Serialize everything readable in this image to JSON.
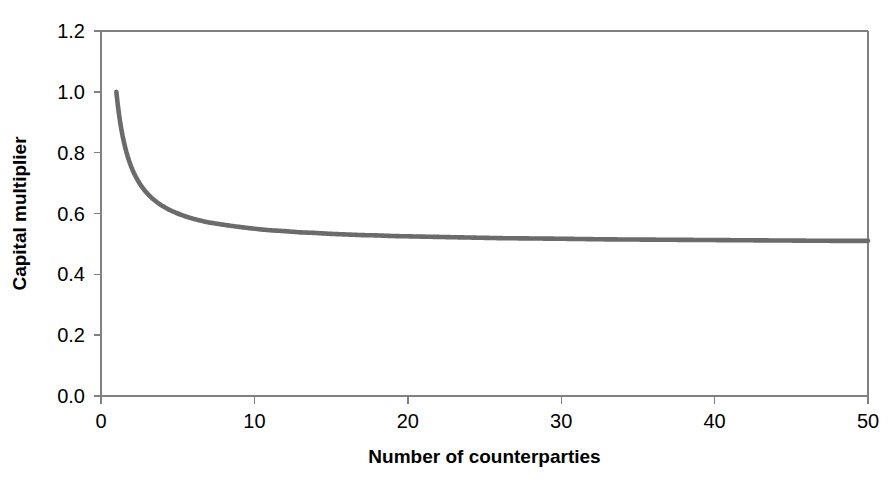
{
  "chart_data": {
    "type": "line",
    "title": "",
    "subtitle": "",
    "xlabel": "Number of counterparties",
    "ylabel": "Capital multiplier",
    "xlim": [
      0,
      50
    ],
    "ylim": [
      0.0,
      1.2
    ],
    "xticks": [
      0,
      10,
      20,
      30,
      40,
      50
    ],
    "xticklabels": [
      "0",
      "10",
      "20",
      "30",
      "40",
      "50"
    ],
    "yticks": [
      0.0,
      0.2,
      0.4,
      0.6,
      0.8,
      1.0,
      1.2
    ],
    "yticklabels": [
      "0.0",
      "0.2",
      "0.4",
      "0.6",
      "0.8",
      "1.0",
      "1.2"
    ],
    "grid": false,
    "legend": false,
    "legend_position": "none",
    "series": [
      {
        "name": "Capital multiplier",
        "color": "#6b6b6b",
        "line_width": 4.6,
        "x": [
          1,
          2,
          3,
          4,
          5,
          6,
          7,
          8,
          9,
          10,
          11,
          12,
          13,
          14,
          15,
          16,
          17,
          18,
          19,
          20,
          22,
          24,
          26,
          28,
          30,
          33,
          36,
          39,
          42,
          45,
          48,
          50
        ],
        "values": [
          1.0,
          0.75,
          0.667,
          0.625,
          0.6,
          0.583,
          0.571,
          0.563,
          0.556,
          0.55,
          0.545,
          0.542,
          0.538,
          0.536,
          0.533,
          0.531,
          0.529,
          0.528,
          0.526,
          0.525,
          0.523,
          0.521,
          0.519,
          0.518,
          0.517,
          0.515,
          0.514,
          0.513,
          0.512,
          0.511,
          0.51,
          0.51
        ]
      }
    ],
    "formula_note": "0.5 + 0.5 / n"
  },
  "plot_geometry": {
    "left": 101,
    "right": 868,
    "top": 31,
    "bottom": 396
  },
  "style": {
    "background": "#ffffff",
    "axis_color": "#808080",
    "text_color": "#000000",
    "series_color": "#6b6b6b"
  }
}
